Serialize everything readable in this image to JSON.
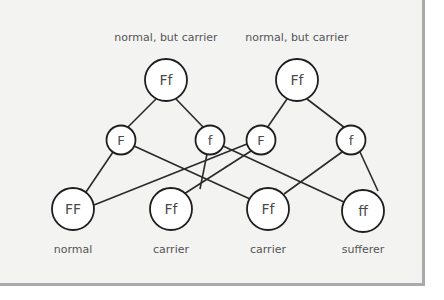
{
  "diagram": {
    "type": "genetic-cross",
    "colors": {
      "background": "#f3f3f2",
      "frame_shadow": "#a9a9a9",
      "node_fill": "#ffffff",
      "node_stroke": "#1e1e1e",
      "text": "#555555"
    },
    "parents": [
      {
        "id": "p1",
        "genotype": "Ff",
        "label": "normal, but carrier"
      },
      {
        "id": "p2",
        "genotype": "Ff",
        "label": "normal, but carrier"
      }
    ],
    "gametes": [
      {
        "id": "g1",
        "allele": "F",
        "parent": "p1"
      },
      {
        "id": "g2",
        "allele": "f",
        "parent": "p1"
      },
      {
        "id": "g3",
        "allele": "F",
        "parent": "p2"
      },
      {
        "id": "g4",
        "allele": "f",
        "parent": "p2"
      }
    ],
    "offspring": [
      {
        "id": "o1",
        "genotype": "FF",
        "label": "normal"
      },
      {
        "id": "o2",
        "genotype": "Ff",
        "label": "carrier"
      },
      {
        "id": "o3",
        "genotype": "Ff",
        "label": "carrier"
      },
      {
        "id": "o4",
        "genotype": "ff",
        "label": "sufferer"
      }
    ],
    "edges": [
      [
        "p1",
        "g1"
      ],
      [
        "p1",
        "g2"
      ],
      [
        "p2",
        "g3"
      ],
      [
        "p2",
        "g4"
      ],
      [
        "g1",
        "o1"
      ],
      [
        "g1",
        "o3"
      ],
      [
        "g2",
        "o2"
      ],
      [
        "g2",
        "o4"
      ],
      [
        "g3",
        "o1"
      ],
      [
        "g3",
        "o2"
      ],
      [
        "g4",
        "o3"
      ],
      [
        "g4",
        "o4"
      ]
    ]
  }
}
